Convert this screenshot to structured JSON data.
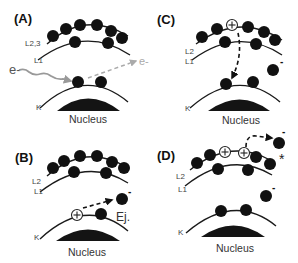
{
  "figure": {
    "panels": [
      {
        "id": "A",
        "label": "(A)",
        "shells": [
          "L2,3",
          "L1",
          "K"
        ],
        "incident_particle": "e-",
        "scattered_particle": "e-",
        "nucleus_label": "Nucleus"
      },
      {
        "id": "B",
        "label": "(B)",
        "shells": [
          "L2",
          "L1",
          "K"
        ],
        "ejected_label": "Ej.",
        "ejected_charge": "-",
        "nucleus_label": "Nucleus"
      },
      {
        "id": "C",
        "label": "(C)",
        "shells": [
          "L2",
          "L1",
          "K"
        ],
        "free_charge": "-",
        "nucleus_label": "Nucleus"
      },
      {
        "id": "D",
        "label": "(D)",
        "shells": [
          "L2",
          "L1",
          "K"
        ],
        "auger_charge": "-",
        "auger_marker": "*",
        "free_charge": "-",
        "nucleus_label": "Nucleus"
      }
    ]
  },
  "colors": {
    "electron": "#111111",
    "orbit": "#1a1a1a",
    "incident_arrow": "#999999",
    "scatter_arrow": "#aaaaaa",
    "background": "#ffffff"
  }
}
